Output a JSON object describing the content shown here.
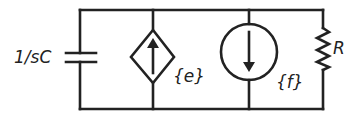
{
  "diagram": {
    "type": "circuit",
    "components": [
      {
        "id": "capacitor",
        "kind": "capacitor",
        "label": "1/sC"
      },
      {
        "id": "dependent-current-source",
        "kind": "dependent current source (diamond, arrow up)",
        "label": "{e}"
      },
      {
        "id": "current-source",
        "kind": "independent current source (circle, arrow down)",
        "label": "{f}"
      },
      {
        "id": "resistor",
        "kind": "resistor",
        "label": "R"
      }
    ],
    "connection": "all four components in parallel between top and bottom wires",
    "colors": {
      "stroke": "#222222",
      "background": "#ffffff"
    }
  }
}
